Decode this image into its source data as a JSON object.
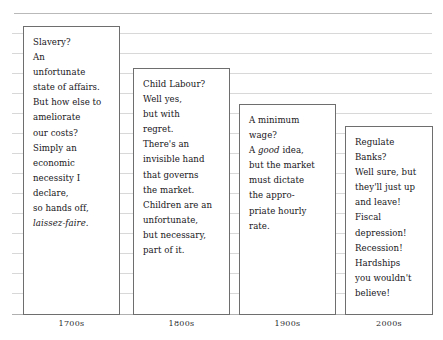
{
  "chart_data": {
    "type": "bar",
    "title": "",
    "subtitle": "",
    "xlabel": "",
    "ylabel": "",
    "grid": true,
    "legend": false,
    "categories": [
      "1700s",
      "1800s",
      "1900s",
      "2000s"
    ],
    "values": [
      289,
      247,
      211,
      189
    ],
    "value_units": "px height of annotation box above baseline",
    "annotations": [
      {
        "category": "1700s",
        "lines": [
          "Slavery?",
          "An",
          "unfortunate",
          "state of affairs.",
          "But how else to",
          "ameliorate",
          "our costs?",
          "Simply an",
          "economic",
          "necessity I",
          "declare,",
          "so hands off,",
          "laissez-faire."
        ],
        "italic_lines": [
          "laissez-faire."
        ],
        "italic_words": []
      },
      {
        "category": "1800s",
        "lines": [
          "Child Labour?",
          "Well yes,",
          "but with",
          "regret.",
          "There's an",
          "invisible hand",
          "that governs",
          "the market.",
          "Children are an",
          "unfortunate,",
          "but necessary,",
          "part of it."
        ],
        "italic_lines": [],
        "italic_words": []
      },
      {
        "category": "1900s",
        "lines": [
          "A minimum",
          "wage?",
          "A good idea,",
          "but the market",
          "must dictate",
          "the appro-",
          "priate hourly",
          "rate."
        ],
        "italic_lines": [],
        "italic_words": [
          "good"
        ]
      },
      {
        "category": "2000s",
        "lines": [
          "Regulate",
          "Banks?",
          "Well sure, but",
          "they'll just up",
          "and leave!",
          "Fiscal",
          "depression!",
          "Recession!",
          "Hardships",
          "you wouldn't",
          "believe!"
        ],
        "italic_lines": [],
        "italic_words": []
      }
    ],
    "colors": {
      "box_border": "#6e6e6e",
      "box_fill": "#ffffff",
      "gridline": "#d8d8d8",
      "axis_line": "#b0b0b0",
      "text": "#17161a",
      "background": "#ffffff"
    }
  },
  "axis": {
    "ticks": [
      {
        "label": "1700s"
      },
      {
        "label": "1800s"
      },
      {
        "label": "1900s"
      },
      {
        "label": "2000s"
      }
    ]
  }
}
